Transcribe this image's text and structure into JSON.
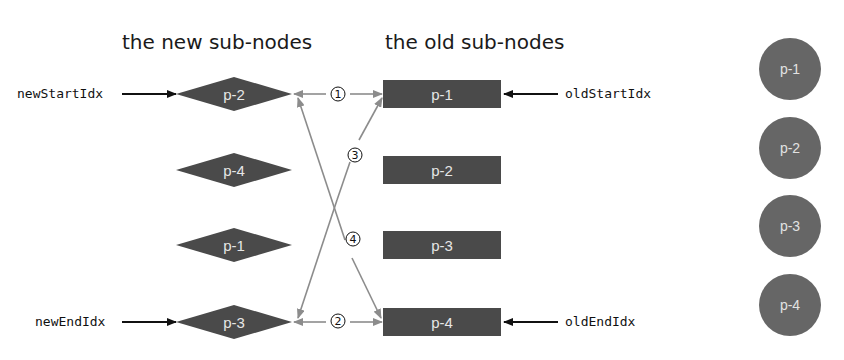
{
  "headings": {
    "new": "the new sub-nodes",
    "old": "the old sub-nodes"
  },
  "pointers": {
    "new_start": "newStartIdx",
    "new_end": "newEndIdx",
    "old_start": "oldStartIdx",
    "old_end": "oldEndIdx"
  },
  "new_nodes": [
    {
      "label": "p-2"
    },
    {
      "label": "p-4"
    },
    {
      "label": "p-1"
    },
    {
      "label": "p-3"
    }
  ],
  "old_nodes": [
    {
      "label": "p-1"
    },
    {
      "label": "p-2"
    },
    {
      "label": "p-3"
    },
    {
      "label": "p-4"
    }
  ],
  "real_dom_nodes": [
    {
      "label": "p-1"
    },
    {
      "label": "p-2"
    },
    {
      "label": "p-3"
    },
    {
      "label": "p-4"
    }
  ],
  "comparisons": [
    {
      "step": "①",
      "from": "newStart",
      "to": "oldStart"
    },
    {
      "step": "②",
      "from": "newEnd",
      "to": "oldEnd"
    },
    {
      "step": "③",
      "from": "newEnd",
      "to": "oldStart"
    },
    {
      "step": "④",
      "from": "newStart",
      "to": "oldEnd"
    }
  ],
  "colors": {
    "node_fill": "#4a4a4a",
    "dom_node_fill": "#666666",
    "comparison_line": "#8c8c8c",
    "pointer_arrow": "#111111"
  }
}
